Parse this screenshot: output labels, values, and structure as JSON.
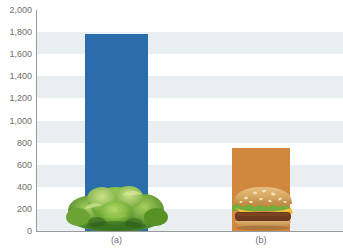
{
  "chart_data": {
    "type": "bar",
    "title": "",
    "subtitle": "",
    "xlabel": "",
    "ylabel": "",
    "categories": [
      "(a)",
      "(b)"
    ],
    "values": [
      1780,
      750
    ],
    "series": [
      {
        "name": "value",
        "values": [
          1780,
          750
        ]
      }
    ],
    "ylim": [
      0,
      2000
    ],
    "ytick_values": [
      0,
      200,
      400,
      600,
      800,
      1000,
      1200,
      1400,
      1600,
      1800,
      2000
    ],
    "ytick_labels": [
      "0",
      "200",
      "400",
      "600",
      "800",
      "1,000",
      "1,200",
      "1,400",
      "1,600",
      "1,800",
      "2,000"
    ],
    "grid": "horizontal-bands",
    "legend": "none",
    "bar_colors": [
      "#2b6cab",
      "#d2873f"
    ],
    "annotations": [
      {
        "category": "(a)",
        "image": "lettuce"
      },
      {
        "category": "(b)",
        "image": "hamburger"
      }
    ]
  },
  "axis": {
    "line_color": "#9a9a9a",
    "band_color": "#e9eff0",
    "tick_text_color": "#6d6d6d"
  },
  "labels": {
    "a": "(a)",
    "b": "(b)"
  }
}
